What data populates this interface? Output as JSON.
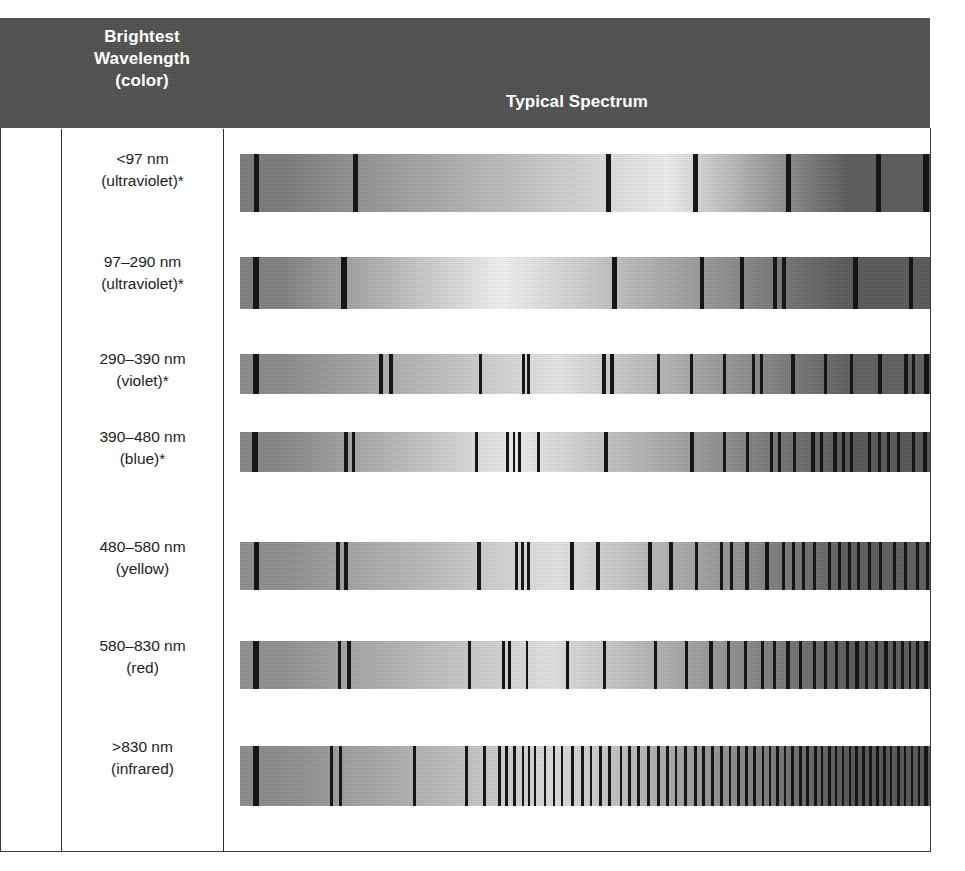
{
  "figure": {
    "type": "table",
    "header": {
      "col_blank": "",
      "col_wavelength": "Brightest\nWavelength\n(color)",
      "col_wavelength_lines": [
        "Brightest",
        "Wavelength",
        "(color)"
      ],
      "col_spectrum": "Typical Spectrum"
    },
    "header_bg": "#4f4f4f",
    "header_text_color": "#ffffff",
    "border_color": "#3a3a3a",
    "line_color": "#16161a",
    "rows": [
      {
        "wavelength": "<97 nm",
        "color": "(ultraviolet)*",
        "spectrum_name": "spectrum-band-ultraviolet-lt97",
        "grad_peak_pct": 62,
        "grad_dark_left": "#7b7b7b",
        "grad_bright": "#f0f0f0",
        "grad_dark_right": "#5a5a5a",
        "lines": [
          {
            "x": 2.0,
            "w": 0.75
          },
          {
            "x": 16.4,
            "w": 0.72
          },
          {
            "x": 53.0,
            "w": 0.72
          },
          {
            "x": 65.6,
            "w": 0.72
          },
          {
            "x": 79.2,
            "w": 0.72
          },
          {
            "x": 92.2,
            "w": 0.72
          },
          {
            "x": 99.0,
            "w": 0.8
          }
        ]
      },
      {
        "wavelength": "97–290 nm",
        "color": "(ultraviolet)*",
        "spectrum_name": "spectrum-band-ultraviolet-97-290",
        "grad_peak_pct": 38,
        "grad_dark_left": "#808080",
        "grad_bright": "#f4f4f4",
        "grad_dark_right": "#585858",
        "lines": [
          {
            "x": 1.9,
            "w": 0.8
          },
          {
            "x": 14.7,
            "w": 0.8
          },
          {
            "x": 53.9,
            "w": 0.8
          },
          {
            "x": 66.6,
            "w": 0.7
          },
          {
            "x": 72.4,
            "w": 0.7
          },
          {
            "x": 77.3,
            "w": 0.55
          },
          {
            "x": 78.6,
            "w": 0.55
          },
          {
            "x": 88.9,
            "w": 0.7
          },
          {
            "x": 96.9,
            "w": 0.6
          }
        ]
      },
      {
        "wavelength": "290–390 nm",
        "color": "(violet)*",
        "spectrum_name": "spectrum-band-violet",
        "grad_peak_pct": 46,
        "grad_dark_left": "#8a8a8a",
        "grad_bright": "#e8e8e8",
        "grad_dark_right": "#5e5e5e",
        "lines": [
          {
            "x": 1.9,
            "w": 0.8
          },
          {
            "x": 20.2,
            "w": 0.5
          },
          {
            "x": 21.6,
            "w": 0.6
          },
          {
            "x": 34.6,
            "w": 0.45
          },
          {
            "x": 40.8,
            "w": 0.45
          },
          {
            "x": 41.6,
            "w": 0.45
          },
          {
            "x": 52.5,
            "w": 0.6
          },
          {
            "x": 53.6,
            "w": 0.6
          },
          {
            "x": 60.4,
            "w": 0.5
          },
          {
            "x": 65.2,
            "w": 0.5
          },
          {
            "x": 70.0,
            "w": 0.5
          },
          {
            "x": 74.2,
            "w": 0.5
          },
          {
            "x": 75.4,
            "w": 0.45
          },
          {
            "x": 79.9,
            "w": 0.5
          },
          {
            "x": 84.6,
            "w": 0.5
          },
          {
            "x": 88.4,
            "w": 0.5
          },
          {
            "x": 92.5,
            "w": 0.5
          },
          {
            "x": 96.3,
            "w": 0.5
          },
          {
            "x": 97.4,
            "w": 0.5
          },
          {
            "x": 99.2,
            "w": 0.6
          }
        ]
      },
      {
        "wavelength": "390–480 nm",
        "color": "(blue)*",
        "spectrum_name": "spectrum-band-blue",
        "grad_peak_pct": 40,
        "grad_dark_left": "#868686",
        "grad_bright": "#efefef",
        "grad_dark_right": "#555555",
        "lines": [
          {
            "x": 1.8,
            "w": 0.75
          },
          {
            "x": 15.0,
            "w": 0.6
          },
          {
            "x": 16.2,
            "w": 0.5
          },
          {
            "x": 34.0,
            "w": 0.5
          },
          {
            "x": 38.6,
            "w": 0.4
          },
          {
            "x": 39.5,
            "w": 0.4
          },
          {
            "x": 40.3,
            "w": 0.4
          },
          {
            "x": 43.0,
            "w": 0.45
          },
          {
            "x": 52.8,
            "w": 0.55
          },
          {
            "x": 65.2,
            "w": 0.55
          },
          {
            "x": 70.0,
            "w": 0.5
          },
          {
            "x": 73.3,
            "w": 0.5
          },
          {
            "x": 76.8,
            "w": 0.5
          },
          {
            "x": 78.0,
            "w": 0.45
          },
          {
            "x": 80.1,
            "w": 0.5
          },
          {
            "x": 82.8,
            "w": 0.5
          },
          {
            "x": 84.0,
            "w": 0.45
          },
          {
            "x": 86.0,
            "w": 0.5
          },
          {
            "x": 87.2,
            "w": 0.45
          },
          {
            "x": 88.4,
            "w": 0.45
          },
          {
            "x": 91.0,
            "w": 0.5
          },
          {
            "x": 92.4,
            "w": 0.5
          },
          {
            "x": 93.8,
            "w": 0.45
          },
          {
            "x": 95.2,
            "w": 0.5
          },
          {
            "x": 97.4,
            "w": 0.5
          },
          {
            "x": 99.0,
            "w": 0.5
          }
        ]
      },
      {
        "wavelength": "480–580 nm",
        "color": "(yellow)",
        "spectrum_name": "spectrum-band-yellow",
        "grad_peak_pct": 46,
        "grad_dark_left": "#8e8e8e",
        "grad_bright": "#e6e6e6",
        "grad_dark_right": "#5c5c5c",
        "lines": [
          {
            "x": 2.0,
            "w": 0.8
          },
          {
            "x": 13.9,
            "w": 0.6
          },
          {
            "x": 15.1,
            "w": 0.55
          },
          {
            "x": 34.3,
            "w": 0.6
          },
          {
            "x": 39.9,
            "w": 0.4
          },
          {
            "x": 40.7,
            "w": 0.4
          },
          {
            "x": 41.6,
            "w": 0.4
          },
          {
            "x": 47.8,
            "w": 0.55
          },
          {
            "x": 51.6,
            "w": 0.55
          },
          {
            "x": 59.1,
            "w": 0.55
          },
          {
            "x": 62.2,
            "w": 0.5
          },
          {
            "x": 65.9,
            "w": 0.5
          },
          {
            "x": 69.5,
            "w": 0.5
          },
          {
            "x": 71.0,
            "w": 0.45
          },
          {
            "x": 73.2,
            "w": 0.5
          },
          {
            "x": 76.1,
            "w": 0.5
          },
          {
            "x": 78.5,
            "w": 0.45
          },
          {
            "x": 80.0,
            "w": 0.45
          },
          {
            "x": 81.4,
            "w": 0.45
          },
          {
            "x": 83.0,
            "w": 0.5
          },
          {
            "x": 85.2,
            "w": 0.45
          },
          {
            "x": 86.6,
            "w": 0.45
          },
          {
            "x": 88.1,
            "w": 0.45
          },
          {
            "x": 89.4,
            "w": 0.45
          },
          {
            "x": 91.0,
            "w": 0.45
          },
          {
            "x": 92.6,
            "w": 0.45
          },
          {
            "x": 94.6,
            "w": 0.5
          },
          {
            "x": 96.2,
            "w": 0.45
          },
          {
            "x": 98.0,
            "w": 0.45
          },
          {
            "x": 99.4,
            "w": 0.5
          }
        ]
      },
      {
        "wavelength": "580–830 nm",
        "color": "(red)",
        "spectrum_name": "spectrum-band-red",
        "grad_peak_pct": 45,
        "grad_dark_left": "#909090",
        "grad_bright": "#e4e4e4",
        "grad_dark_right": "#5a5a5a",
        "lines": [
          {
            "x": 1.9,
            "w": 0.8
          },
          {
            "x": 14.2,
            "w": 0.5
          },
          {
            "x": 15.5,
            "w": 0.55
          },
          {
            "x": 33.0,
            "w": 0.5
          },
          {
            "x": 38.0,
            "w": 0.4
          },
          {
            "x": 38.9,
            "w": 0.4
          },
          {
            "x": 41.4,
            "w": 0.4
          },
          {
            "x": 47.2,
            "w": 0.5
          },
          {
            "x": 52.6,
            "w": 0.5
          },
          {
            "x": 60.0,
            "w": 0.5
          },
          {
            "x": 64.5,
            "w": 0.5
          },
          {
            "x": 68.0,
            "w": 0.5
          },
          {
            "x": 70.6,
            "w": 0.45
          },
          {
            "x": 73.0,
            "w": 0.5
          },
          {
            "x": 75.5,
            "w": 0.5
          },
          {
            "x": 77.2,
            "w": 0.45
          },
          {
            "x": 79.2,
            "w": 0.5
          },
          {
            "x": 81.0,
            "w": 0.45
          },
          {
            "x": 83.0,
            "w": 0.45
          },
          {
            "x": 84.6,
            "w": 0.45
          },
          {
            "x": 86.2,
            "w": 0.5
          },
          {
            "x": 87.8,
            "w": 0.45
          },
          {
            "x": 89.2,
            "w": 0.45
          },
          {
            "x": 90.6,
            "w": 0.45
          },
          {
            "x": 92.0,
            "w": 0.45
          },
          {
            "x": 93.4,
            "w": 0.45
          },
          {
            "x": 94.6,
            "w": 0.45
          },
          {
            "x": 95.8,
            "w": 0.45
          },
          {
            "x": 96.9,
            "w": 0.4
          },
          {
            "x": 98.0,
            "w": 0.45
          },
          {
            "x": 99.2,
            "w": 0.5
          }
        ]
      },
      {
        "wavelength": ">830 nm",
        "color": "(infrared)",
        "spectrum_name": "spectrum-band-infrared",
        "grad_peak_pct": 46,
        "grad_dark_left": "#8c8c8c",
        "grad_bright": "#dedede",
        "grad_dark_right": "#565656",
        "lines": [
          {
            "x": 1.9,
            "w": 0.8
          },
          {
            "x": 13.0,
            "w": 0.5
          },
          {
            "x": 14.3,
            "w": 0.55
          },
          {
            "x": 25.0,
            "w": 0.45
          },
          {
            "x": 32.6,
            "w": 0.5
          },
          {
            "x": 35.2,
            "w": 0.5
          },
          {
            "x": 37.4,
            "w": 0.4
          },
          {
            "x": 38.4,
            "w": 0.4
          },
          {
            "x": 39.6,
            "w": 0.4
          },
          {
            "x": 40.8,
            "w": 0.4
          },
          {
            "x": 41.7,
            "w": 0.35
          },
          {
            "x": 42.6,
            "w": 0.35
          },
          {
            "x": 44.0,
            "w": 0.4
          },
          {
            "x": 45.3,
            "w": 0.4
          },
          {
            "x": 46.5,
            "w": 0.35
          },
          {
            "x": 48.0,
            "w": 0.4
          },
          {
            "x": 49.4,
            "w": 0.4
          },
          {
            "x": 50.7,
            "w": 0.35
          },
          {
            "x": 52.0,
            "w": 0.4
          },
          {
            "x": 53.4,
            "w": 0.4
          },
          {
            "x": 55.0,
            "w": 0.4
          },
          {
            "x": 56.3,
            "w": 0.4
          },
          {
            "x": 57.6,
            "w": 0.4
          },
          {
            "x": 59.0,
            "w": 0.4
          },
          {
            "x": 60.4,
            "w": 0.4
          },
          {
            "x": 61.8,
            "w": 0.4
          },
          {
            "x": 63.0,
            "w": 0.4
          },
          {
            "x": 64.4,
            "w": 0.4
          },
          {
            "x": 65.8,
            "w": 0.4
          },
          {
            "x": 67.0,
            "w": 0.4
          },
          {
            "x": 68.3,
            "w": 0.4
          },
          {
            "x": 69.6,
            "w": 0.4
          },
          {
            "x": 70.8,
            "w": 0.4
          },
          {
            "x": 72.0,
            "w": 0.4
          },
          {
            "x": 73.2,
            "w": 0.4
          },
          {
            "x": 74.4,
            "w": 0.4
          },
          {
            "x": 75.6,
            "w": 0.4
          },
          {
            "x": 76.6,
            "w": 0.35
          },
          {
            "x": 77.7,
            "w": 0.4
          },
          {
            "x": 78.8,
            "w": 0.35
          },
          {
            "x": 79.9,
            "w": 0.4
          },
          {
            "x": 81.0,
            "w": 0.4
          },
          {
            "x": 82.1,
            "w": 0.35
          },
          {
            "x": 83.2,
            "w": 0.4
          },
          {
            "x": 84.2,
            "w": 0.35
          },
          {
            "x": 85.2,
            "w": 0.4
          },
          {
            "x": 86.2,
            "w": 0.35
          },
          {
            "x": 87.2,
            "w": 0.4
          },
          {
            "x": 88.2,
            "w": 0.35
          },
          {
            "x": 89.2,
            "w": 0.4
          },
          {
            "x": 90.2,
            "w": 0.35
          },
          {
            "x": 91.2,
            "w": 0.4
          },
          {
            "x": 92.2,
            "w": 0.35
          },
          {
            "x": 93.2,
            "w": 0.4
          },
          {
            "x": 94.2,
            "w": 0.35
          },
          {
            "x": 95.2,
            "w": 0.4
          },
          {
            "x": 96.2,
            "w": 0.35
          },
          {
            "x": 97.2,
            "w": 0.4
          },
          {
            "x": 98.2,
            "w": 0.4
          },
          {
            "x": 99.2,
            "w": 0.5
          }
        ]
      }
    ],
    "row_geometry": [
      {
        "top": 140,
        "label_top": 8,
        "band_top": 14,
        "band_height": 58,
        "height": 100
      },
      {
        "top": 243,
        "label_top": 8,
        "band_top": 14,
        "band_height": 52,
        "height": 95
      },
      {
        "top": 340,
        "label_top": 8,
        "band_top": 14,
        "band_height": 40,
        "height": 83
      },
      {
        "top": 418,
        "label_top": 8,
        "band_top": 14,
        "band_height": 40,
        "height": 83
      },
      {
        "top": 528,
        "label_top": 8,
        "band_top": 14,
        "band_height": 48,
        "height": 95
      },
      {
        "top": 627,
        "label_top": 8,
        "band_top": 14,
        "band_height": 48,
        "height": 95
      },
      {
        "top": 722,
        "label_top": 14,
        "band_top": 24,
        "band_height": 60,
        "height": 110
      }
    ]
  }
}
